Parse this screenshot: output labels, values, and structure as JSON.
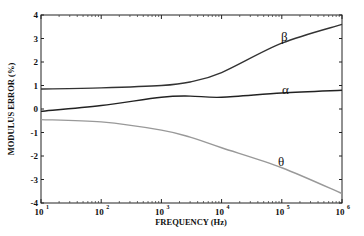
{
  "chart_data": {
    "type": "line",
    "title": "",
    "xlabel": "FREQUENCY (Hz)",
    "ylabel": "MODULUS ERROR (%)",
    "xscale": "log",
    "xlim": [
      10,
      1000000
    ],
    "ylim": [
      -4,
      4
    ],
    "grid": false,
    "legend": "inline curve labels",
    "x_ticks": [
      {
        "base": "10",
        "exp": "1"
      },
      {
        "base": "10",
        "exp": "2"
      },
      {
        "base": "10",
        "exp": "3"
      },
      {
        "base": "10",
        "exp": "4"
      },
      {
        "base": "10",
        "exp": "5"
      },
      {
        "base": "10",
        "exp": "6"
      }
    ],
    "y_ticks": [
      "4",
      "3",
      "2",
      "1",
      "0",
      "-1",
      "-2",
      "-3",
      "-4"
    ],
    "x": [
      10,
      100,
      1000,
      3000,
      10000,
      100000,
      1000000
    ],
    "series": [
      {
        "name": "β",
        "color": "#333333",
        "values": [
          0.85,
          0.9,
          1.0,
          1.15,
          1.55,
          2.8,
          3.6
        ],
        "label_pos": {
          "x": 281,
          "y": 41
        }
      },
      {
        "name": "α",
        "color": "#222222",
        "values": [
          -0.1,
          0.15,
          0.5,
          0.55,
          0.5,
          0.68,
          0.8
        ],
        "label_pos": {
          "x": 282,
          "y": 94
        }
      },
      {
        "name": "θ",
        "color": "#999999",
        "values": [
          -0.45,
          -0.55,
          -0.9,
          -1.2,
          -1.65,
          -2.5,
          -3.6
        ],
        "label_pos": {
          "x": 278,
          "y": 166
        }
      }
    ]
  }
}
